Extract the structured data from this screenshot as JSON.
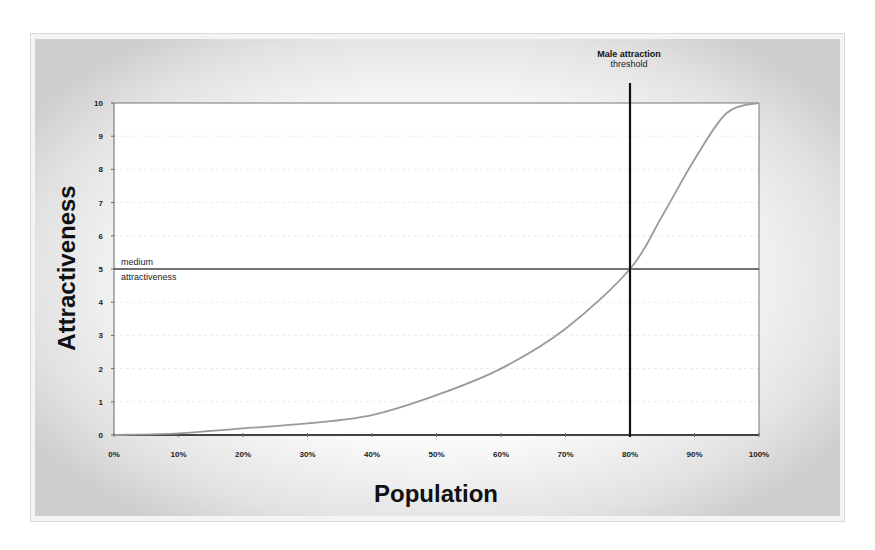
{
  "chart_data": {
    "type": "line",
    "title": "",
    "xlabel": "Population",
    "ylabel": "Attractiveness",
    "x_tick_labels": [
      "0%",
      "10%",
      "20%",
      "30%",
      "40%",
      "50%",
      "60%",
      "70%",
      "80%",
      "90%",
      "100%"
    ],
    "y_tick_labels": [
      "0",
      "1",
      "2",
      "3",
      "4",
      "5",
      "6",
      "7",
      "8",
      "9",
      "10"
    ],
    "xlim": [
      0,
      100
    ],
    "ylim": [
      0,
      10
    ],
    "grid": false,
    "legend": null,
    "series": [
      {
        "name": "Attractiveness curve",
        "x": [
          0,
          10,
          20,
          30,
          40,
          50,
          60,
          70,
          80,
          85,
          90,
          95,
          100
        ],
        "y": [
          0,
          0.05,
          0.2,
          0.35,
          0.6,
          1.2,
          2.0,
          3.2,
          5.0,
          6.6,
          8.3,
          9.7,
          10.0
        ]
      }
    ],
    "reference_lines": [
      {
        "orientation": "horizontal",
        "value": 5,
        "label_top": "medium",
        "label_bottom": "attractiveness"
      },
      {
        "orientation": "vertical",
        "value": 80,
        "label": "Male attraction threshold"
      }
    ]
  },
  "annotations": {
    "medium_line_top": "medium",
    "medium_line_bottom": "attractiveness",
    "threshold_line1": "Male attraction",
    "threshold_line2": "threshold"
  },
  "axes": {
    "x_title": "Population",
    "y_title": "Attractiveness",
    "x_ticks": [
      "0%",
      "10%",
      "20%",
      "30%",
      "40%",
      "50%",
      "60%",
      "70%",
      "80%",
      "90%",
      "100%"
    ],
    "y_ticks": [
      "0",
      "1",
      "2",
      "3",
      "4",
      "5",
      "6",
      "7",
      "8",
      "9",
      "10"
    ]
  },
  "colors": {
    "curve": "#9a9a9a",
    "axis": "#555555",
    "threshold": "#111111",
    "medium_line": "#444444"
  }
}
